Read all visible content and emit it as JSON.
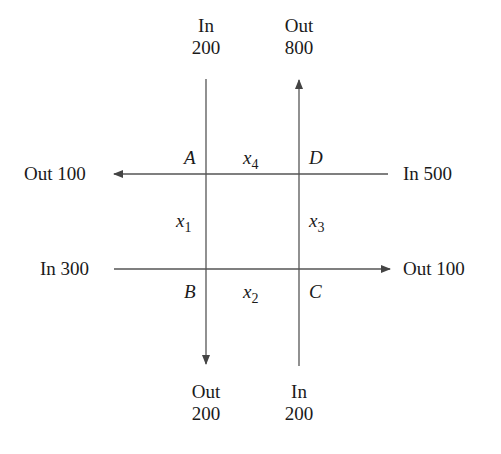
{
  "diagram": {
    "type": "traffic-flow-network",
    "nodes": [
      "A",
      "B",
      "C",
      "D"
    ],
    "flows": {
      "top_left": {
        "direction": "In",
        "value": "200",
        "at": "A"
      },
      "top_right": {
        "direction": "Out",
        "value": "800",
        "at": "D"
      },
      "left_top": {
        "direction": "Out",
        "value": "100",
        "at": "A",
        "label": "Out 100"
      },
      "right_top": {
        "direction": "In",
        "value": "500",
        "at": "D",
        "label": "In 500"
      },
      "left_bottom": {
        "direction": "In",
        "value": "300",
        "at": "B",
        "label": "In 300"
      },
      "right_bottom": {
        "direction": "Out",
        "value": "100",
        "at": "C",
        "label": "Out 100"
      },
      "bottom_left": {
        "direction": "Out",
        "value": "200",
        "at": "B"
      },
      "bottom_right": {
        "direction": "In",
        "value": "200",
        "at": "C"
      }
    },
    "variables": [
      {
        "name": "x",
        "sub": "1",
        "between": "A-B"
      },
      {
        "name": "x",
        "sub": "2",
        "between": "B-C"
      },
      {
        "name": "x",
        "sub": "3",
        "between": "C-D"
      },
      {
        "name": "x",
        "sub": "4",
        "between": "A-D"
      }
    ],
    "line_color": "#555555"
  }
}
